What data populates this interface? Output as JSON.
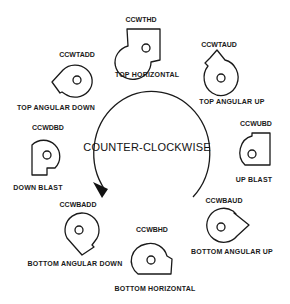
{
  "center": {
    "label": "COUNTER-CLOCKWISE",
    "direction_arrow": "counter-clockwise-arrow"
  },
  "positions": [
    {
      "id": "top-horizontal",
      "code": "CCWTHD",
      "label": "TOP HORIZONTAL"
    },
    {
      "id": "top-angular-up",
      "code": "CCWTAUD",
      "label": "TOP ANGULAR UP"
    },
    {
      "id": "up-blast",
      "code": "CCWUBD",
      "label": "UP BLAST"
    },
    {
      "id": "bottom-angular-up",
      "code": "CCWBAUD",
      "label": "BOTTOM ANGULAR UP"
    },
    {
      "id": "bottom-horizontal",
      "code": "CCWBHD",
      "label": "BOTTOM HORIZONTAL"
    },
    {
      "id": "bottom-angular-down",
      "code": "CCWBADD",
      "label": "BOTTOM ANGULAR DOWN"
    },
    {
      "id": "down-blast",
      "code": "CCWDBD",
      "label": "DOWN BLAST"
    },
    {
      "id": "top-angular-down",
      "code": "CCWTADD",
      "label": "TOP ANGULAR DOWN"
    }
  ]
}
